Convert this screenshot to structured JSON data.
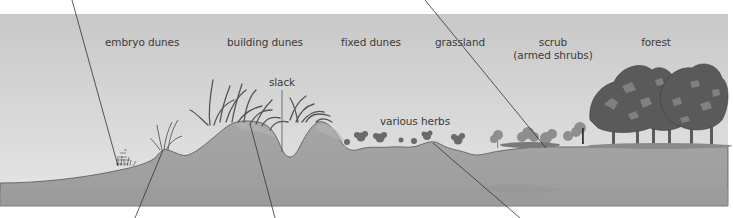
{
  "diagram": {
    "type": "dune-succession-cross-section",
    "zones": [
      {
        "id": "embryo",
        "label": "embryo dunes"
      },
      {
        "id": "building",
        "label": "building dunes"
      },
      {
        "id": "fixed",
        "label": "fixed dunes"
      },
      {
        "id": "grassland",
        "label": "grassland"
      },
      {
        "id": "scrub",
        "label": "scrub",
        "sublabel": "(armed shrubs)"
      },
      {
        "id": "forest",
        "label": "forest"
      }
    ],
    "annotations": {
      "slack": "slack",
      "various_herbs": "various herbs"
    },
    "leader_lines": [
      {
        "from": "top",
        "to": "embryo-plants"
      },
      {
        "from": "top",
        "to": "scrub-shrubs"
      },
      {
        "from": "bottom",
        "to": "embryo-dune-crest"
      },
      {
        "from": "bottom",
        "to": "building-dune"
      },
      {
        "from": "bottom",
        "to": "grassland-soil"
      }
    ],
    "colors": {
      "sky_top": "#c9c9c9",
      "sky_bottom": "#e4e4e4",
      "ground": "#a3a3a3",
      "ground_dark": "#979797",
      "ground_outline": "#555555",
      "vegetation": "#6c6c6c",
      "tree_canopy": "#5a5a5a",
      "tree_highlight": "#8a8a8a",
      "leader_line": "#333333",
      "text": "#3c3c3c"
    }
  }
}
